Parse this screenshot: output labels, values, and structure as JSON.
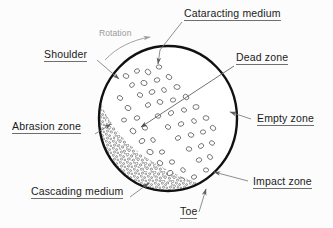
{
  "figure": {
    "background_color": "#fcfcfc",
    "shell": {
      "name": "mill-shell-circle",
      "center": [
        168,
        118.5
      ],
      "radius_x": 70,
      "radius_y": 73.5,
      "stroke_color": "#111111",
      "stroke_width": 2.4
    },
    "rotation_note": {
      "label": "Rotation",
      "color": "#9a9a9a",
      "direction": "clockwise"
    },
    "labels": [
      {
        "id": "cataracting-medium",
        "text": "Cataracting medium",
        "underline": true,
        "position": [
          184,
          8
        ],
        "leader_from": [
          182,
          22
        ],
        "leader_to": [
          158,
          67
        ]
      },
      {
        "id": "shoulder",
        "text": "Shoulder",
        "underline": true,
        "position": [
          44,
          48
        ],
        "leader_from": [
          99,
          61
        ],
        "leader_to": [
          119,
          79
        ]
      },
      {
        "id": "dead-zone",
        "text": "Dead zone",
        "underline": true,
        "position": [
          236,
          52
        ],
        "leader_from": [
          233,
          66
        ],
        "leader_to": [
          141,
          127
        ]
      },
      {
        "id": "empty-zone",
        "text": "Empty zone",
        "underline": true,
        "position": [
          257,
          113
        ],
        "leader_from": [
          255,
          119
        ],
        "leader_to": [
          228,
          112
        ]
      },
      {
        "id": "abrasion-zone",
        "text": "Abrasion zone",
        "underline": true,
        "position": [
          12,
          121
        ],
        "leader_from": [
          95,
          134
        ],
        "leader_to": [
          111,
          124
        ]
      },
      {
        "id": "impact-zone",
        "text": "Impact zone",
        "underline": true,
        "position": [
          253,
          176
        ],
        "leader_from": [
          251,
          182
        ],
        "leader_to": [
          213,
          173
        ]
      },
      {
        "id": "cascading-medium",
        "text": "Cascading medium",
        "underline": true,
        "position": [
          31,
          186
        ],
        "leader_from": [
          131,
          199
        ],
        "leader_to": [
          148,
          183
        ]
      },
      {
        "id": "toe",
        "text": "Toe",
        "underline": true,
        "position": [
          180,
          206
        ],
        "leader_from": [
          200,
          214
        ],
        "leader_to": [
          207,
          186
        ]
      }
    ],
    "zones": [
      {
        "id": "abrasion-zone",
        "description": "dense packed granular bed, lower-left interior"
      },
      {
        "id": "cascading-medium",
        "description": "rolling granular surface along the charge face"
      },
      {
        "id": "cataracting-medium",
        "description": "scattered flying media above the charge"
      },
      {
        "id": "dead-zone",
        "description": "low-motion core of the charge"
      },
      {
        "id": "empty-zone",
        "description": "void region on the upper-right of the shell"
      },
      {
        "id": "impact-zone",
        "description": "media striking shell near the toe"
      },
      {
        "id": "shoulder",
        "description": "upper departure point of the charge"
      },
      {
        "id": "toe",
        "description": "lower impact point of the charge"
      }
    ]
  }
}
